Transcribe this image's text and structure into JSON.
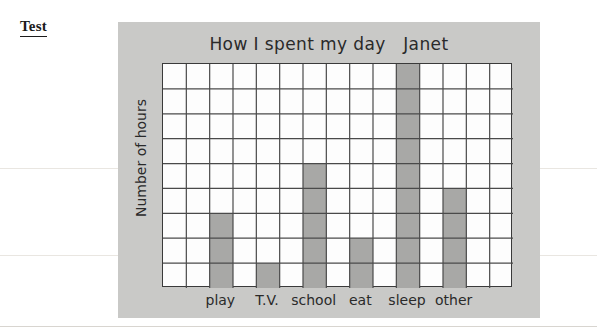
{
  "page": {
    "test_label": "Test",
    "background_color": "#ffffff",
    "panel_color": "#c9c9c7"
  },
  "chart_data": {
    "type": "bar",
    "title": "How I spent my day   Janet",
    "xlabel": "",
    "ylabel": "Number of hours",
    "categories": [
      "play",
      "T.V.",
      "school",
      "eat",
      "sleep",
      "other"
    ],
    "values": [
      3,
      1,
      5,
      2,
      9,
      4
    ],
    "ylim": [
      0,
      9
    ],
    "grid": true,
    "grid_rows": 9,
    "grid_cols": 15,
    "bar_columns": [
      3,
      5,
      7,
      9,
      11,
      13
    ],
    "legend": "none",
    "bar_color": "#a8a8a6",
    "grid_line_color": "#4a4a4a",
    "plot_background": "#fdfdfd",
    "annotations": [
      "Janet"
    ]
  }
}
